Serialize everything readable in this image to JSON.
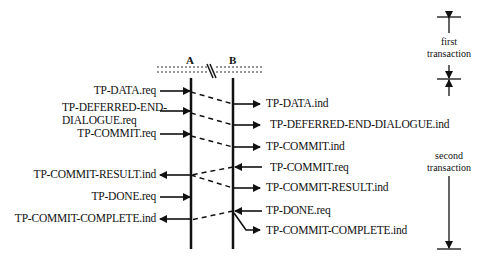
{
  "entities": {
    "a": "A",
    "b": "B"
  },
  "left_labels": [
    "TP-DATA.req",
    "TP-DEFERRED-END-",
    "DIALOGUE.req",
    "TP-COMMIT.req",
    "TP-COMMIT-RESULT.ind",
    "TP-DONE.req",
    "TP-COMMIT-COMPLETE.ind"
  ],
  "right_labels": [
    "TP-DATA.ind",
    "TP-DEFERRED-END-DIALOGUE.ind",
    "TP-COMMIT.ind",
    "TP-COMMIT.req",
    "TP-COMMIT-RESULT.ind",
    "TP-DONE.req",
    "TP-COMMIT-COMPLETE.ind"
  ],
  "brackets": {
    "first": [
      "first",
      "transaction"
    ],
    "second": [
      "second",
      "transaction"
    ]
  }
}
